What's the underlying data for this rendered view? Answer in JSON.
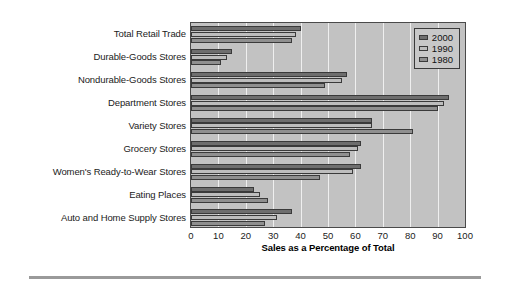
{
  "chart_data": {
    "type": "bar",
    "orientation": "horizontal",
    "title": "",
    "xlabel": "Sales as a Percentage of Total",
    "ylabel": "",
    "xlim": [
      0,
      100
    ],
    "xticks": [
      "0",
      "10",
      "20",
      "30",
      "40",
      "50",
      "60",
      "70",
      "80",
      "90",
      "100"
    ],
    "grid": "vertical-white-gridlines",
    "legend_position": "top-right",
    "categories": [
      "Total Retail Trade",
      "Durable-Goods Stores",
      "Nondurable-Goods Stores",
      "Department Stores",
      "Variety Stores",
      "Grocery Stores",
      "Women's Ready-to-Wear Stores",
      "Eating Places",
      "Auto and Home Supply Stores"
    ],
    "series": [
      {
        "name": "2000",
        "color": "#6e6e6e",
        "values": [
          40,
          15,
          57,
          94,
          66,
          62,
          62,
          23,
          37
        ]
      },
      {
        "name": "1990",
        "color": "#bdbdbd",
        "values": [
          38.5,
          13,
          55,
          92.5,
          66,
          61,
          59,
          25,
          31.5
        ]
      },
      {
        "name": "1980",
        "color": "#8f8f8f",
        "values": [
          37,
          11,
          49,
          90,
          81,
          58,
          47,
          28,
          27
        ]
      }
    ]
  },
  "legend": {
    "items": [
      {
        "label": "2000",
        "swatch": "legend-swatch-2000"
      },
      {
        "label": "1990",
        "swatch": "legend-swatch-1990"
      },
      {
        "label": "1980",
        "swatch": "legend-swatch-1980"
      }
    ]
  },
  "background_text": {
    "line1": "",
    "line2": "",
    "line3": ""
  },
  "colors": {
    "plot_background": "#c2c2c2",
    "gridline": "#efefef",
    "axis_border": "#4a4a4a",
    "bar_outline": "#3a3a3a",
    "rule": "#9a9a9a"
  }
}
